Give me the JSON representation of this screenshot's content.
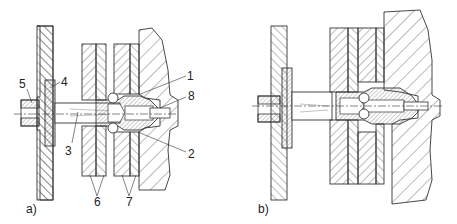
{
  "figures": [
    {
      "id": "a",
      "caption": "a)",
      "callouts": [
        {
          "num": "1",
          "label": "1"
        },
        {
          "num": "2",
          "label": "2"
        },
        {
          "num": "3",
          "label": "3"
        },
        {
          "num": "4",
          "label": "4"
        },
        {
          "num": "5",
          "label": "5"
        },
        {
          "num": "6",
          "label": "6"
        },
        {
          "num": "7",
          "label": "7"
        },
        {
          "num": "8",
          "label": "8"
        }
      ]
    },
    {
      "id": "b",
      "caption": "b)"
    }
  ],
  "colors": {
    "line": "#333333",
    "hatch": "#555555",
    "background": "#ffffff"
  }
}
